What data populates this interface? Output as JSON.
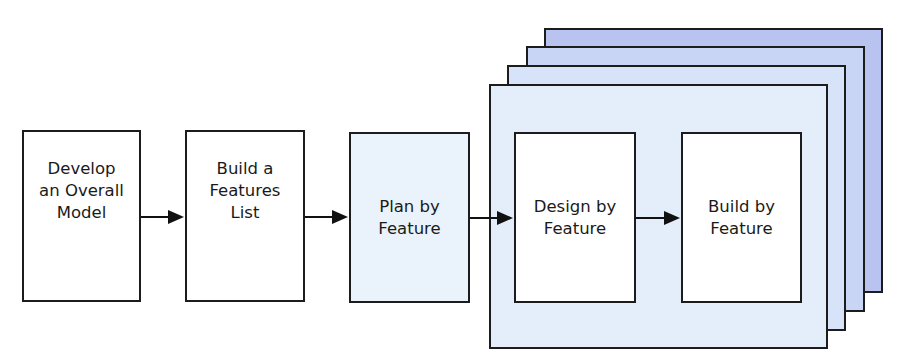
{
  "diagram": {
    "type": "process-flow",
    "colors": {
      "border": "#1c1c1c",
      "plain_box": "#ffffff",
      "plan_box": "#eaf3fb",
      "stack_front": "#e3eefa",
      "stack_2": "#d6e3f8",
      "stack_3": "#c9d5f5",
      "stack_back": "#b8c3f0",
      "arrow": "#111111"
    },
    "steps": [
      {
        "id": "develop",
        "label": "Develop\nan Overall\nModel"
      },
      {
        "id": "features-list",
        "label": "Build a\nFeatures\nList"
      },
      {
        "id": "plan",
        "label": "Plan by\nFeature"
      },
      {
        "id": "design",
        "label": "Design by\nFeature"
      },
      {
        "id": "build",
        "label": "Build by\nFeature"
      }
    ],
    "iteration_group": {
      "description": "Stacked repeating iterations containing Design by Feature and Build by Feature",
      "stack_count": 4
    },
    "edges": [
      {
        "from": "develop",
        "to": "features-list"
      },
      {
        "from": "features-list",
        "to": "plan"
      },
      {
        "from": "plan",
        "to": "design"
      },
      {
        "from": "design",
        "to": "build"
      }
    ]
  }
}
